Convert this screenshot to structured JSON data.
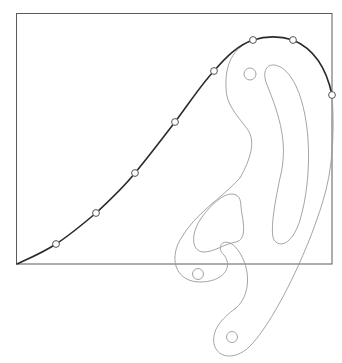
{
  "diagram": {
    "frame": {
      "x1": 16,
      "y1": 13,
      "x2": 332,
      "y2": 264
    },
    "points": [
      {
        "x": 56,
        "y": 244
      },
      {
        "x": 96,
        "y": 213
      },
      {
        "x": 135,
        "y": 173
      },
      {
        "x": 175,
        "y": 122
      },
      {
        "x": 214,
        "y": 71
      },
      {
        "x": 253,
        "y": 40
      },
      {
        "x": 293,
        "y": 40
      },
      {
        "x": 332,
        "y": 95
      }
    ],
    "colors": {
      "frame": "#5a5a5a",
      "curve": "#2a2a2a",
      "template": "#9a9a9a",
      "background": "#ffffff"
    }
  }
}
